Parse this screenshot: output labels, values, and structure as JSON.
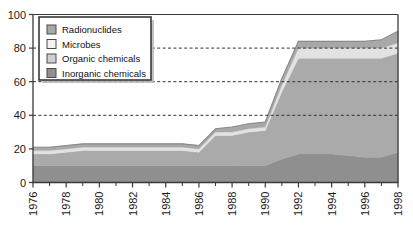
{
  "chart_data": {
    "type": "area",
    "stacked": true,
    "title": "",
    "subtitle": "",
    "xlabel": "",
    "ylabel": "",
    "xlim": [
      1976,
      1998
    ],
    "ylim": [
      0,
      100
    ],
    "yticks": [
      0,
      20,
      40,
      60,
      80,
      100
    ],
    "xticks": [
      1976,
      1978,
      1980,
      1982,
      1984,
      1986,
      1988,
      1990,
      1992,
      1994,
      1996,
      1998
    ],
    "xtick_labels": [
      "1976",
      "1978",
      "1980",
      "1982",
      "1984",
      "1986",
      "1988",
      "1990",
      "1992",
      "1994",
      "1996",
      "1998"
    ],
    "ytick_labels": [
      "0",
      "20",
      "40",
      "60",
      "80",
      "100"
    ],
    "x_minor_ticks": [
      1977,
      1979,
      1981,
      1983,
      1985,
      1987,
      1989,
      1991,
      1993,
      1995,
      1997
    ],
    "xtick_rotation": -90,
    "grid": "horizontal-dashed",
    "gridlines": [
      40,
      60,
      80
    ],
    "legend_position": "top-left",
    "x": [
      1976,
      1977,
      1978,
      1979,
      1980,
      1981,
      1982,
      1983,
      1984,
      1985,
      1986,
      1987,
      1988,
      1989,
      1990,
      1991,
      1992,
      1993,
      1994,
      1995,
      1996,
      1997,
      1998
    ],
    "series": [
      {
        "name": "Inorganic chemicals",
        "color": "#8f8f8f",
        "values": [
          10,
          10,
          10,
          10,
          10,
          10,
          10,
          10,
          10,
          10,
          10,
          10,
          10,
          10,
          10,
          14,
          17,
          17,
          17,
          16,
          15,
          15,
          18
        ]
      },
      {
        "name": "Organic chemicals",
        "color": "#aaaaaa",
        "values": [
          7,
          7,
          8,
          9,
          9,
          9,
          9,
          9,
          9,
          9,
          8,
          18,
          18,
          20,
          21,
          40,
          57,
          57,
          57,
          58,
          59,
          59,
          59
        ]
      },
      {
        "name": "Microbes",
        "color": "#e2e2e2",
        "values": [
          2,
          2,
          2,
          2,
          2,
          2,
          2,
          2,
          2,
          2,
          2,
          2,
          2,
          2,
          2,
          4,
          6,
          6,
          6,
          6,
          6,
          6,
          6
        ]
      },
      {
        "name": "Radionuclides",
        "color": "#a8a8a8",
        "values": [
          2,
          2,
          2,
          2,
          2,
          2,
          2,
          2,
          2,
          2,
          2,
          2,
          3,
          3,
          3,
          4,
          4,
          4,
          4,
          4,
          4,
          5,
          7
        ]
      }
    ],
    "totals": [
      21,
      21,
      22,
      23,
      23,
      23,
      23,
      23,
      23,
      23,
      22,
      32,
      33,
      35,
      36,
      62,
      84,
      84,
      84,
      84,
      84,
      85,
      90
    ]
  },
  "legend": {
    "items": [
      {
        "label": "Radionuclides",
        "swatch": "#a8a8a8"
      },
      {
        "label": "Microbes",
        "swatch": "#f2f2f2"
      },
      {
        "label": "Organic chemicals",
        "swatch": "#cfcfcf"
      },
      {
        "label": "Inorganic chemicals",
        "swatch": "#8f8f8f"
      }
    ],
    "background": "#ffffff",
    "border": "#3a3a3a"
  },
  "style": {
    "axis_color": "#3a3a3a",
    "plot_background": "#ffffff",
    "grid_color": "#333333",
    "text_color": "#1a1a1a"
  }
}
